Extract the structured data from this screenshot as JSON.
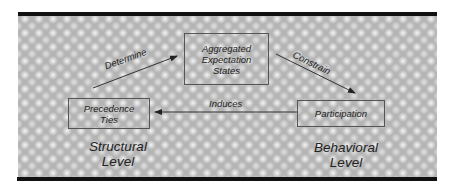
{
  "diagram": {
    "nodes": [
      {
        "id": "aggregated",
        "label": "Aggregated\nExpectation\nStates"
      },
      {
        "id": "precedence",
        "label": "Precedence\nTies"
      },
      {
        "id": "participation",
        "label": "Participation"
      }
    ],
    "edges": [
      {
        "from": "precedence",
        "to": "aggregated",
        "label": "Determine"
      },
      {
        "from": "aggregated",
        "to": "participation",
        "label": "Constrain"
      },
      {
        "from": "participation",
        "to": "precedence",
        "label": "Induces"
      }
    ],
    "levels": [
      {
        "id": "structural",
        "label": "Structural\nLevel"
      },
      {
        "id": "behavioral",
        "label": "Behavioral\nLevel"
      }
    ],
    "colors": {
      "background": "#b4b4b4",
      "bar": "#111111",
      "stroke": "#333333"
    }
  }
}
